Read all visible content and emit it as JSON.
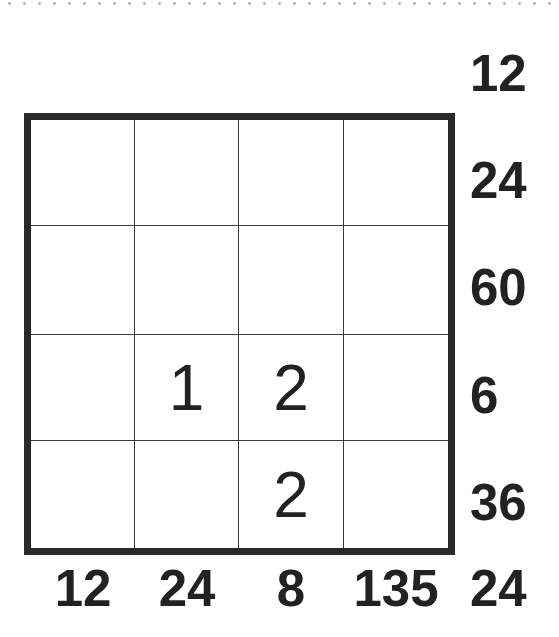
{
  "puzzle": {
    "size": 4,
    "grid": [
      [
        "",
        "",
        "",
        ""
      ],
      [
        "",
        "",
        "",
        ""
      ],
      [
        "",
        "1",
        "2",
        ""
      ],
      [
        "",
        "",
        "2",
        ""
      ]
    ],
    "top_right_clue": "12",
    "row_clues": [
      "24",
      "60",
      "6",
      "36"
    ],
    "column_clues": [
      "12",
      "24",
      "8",
      "135"
    ],
    "corner_clue": "24"
  },
  "colors": {
    "text": "#222222",
    "border": "#2a2a2a",
    "grid_line": "#3a3a3a",
    "background": "#ffffff",
    "dotted_rule": "#b5b5b5"
  }
}
